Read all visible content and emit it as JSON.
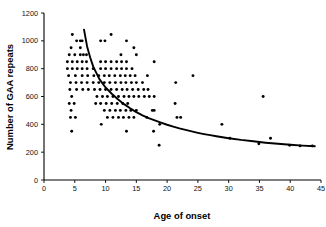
{
  "chart_data": {
    "type": "scatter",
    "title": "",
    "xlabel": "Age of onset",
    "ylabel": "Number of GAA repeats",
    "xlim": [
      0,
      45
    ],
    "ylim": [
      0,
      1200
    ],
    "xticks": [
      0,
      5,
      10,
      15,
      20,
      25,
      30,
      35,
      40,
      45
    ],
    "yticks": [
      0,
      200,
      400,
      600,
      800,
      1000,
      1200
    ],
    "grid": false,
    "legend": "none",
    "marker": "filled-circle",
    "marker_color": "#000000",
    "series": [
      {
        "name": "patients",
        "points": [
          [
            4.6,
            1045
          ],
          [
            6.2,
            1000
          ],
          [
            5.9,
            1000
          ],
          [
            5.3,
            1000
          ],
          [
            9.2,
            1000
          ],
          [
            9.9,
            1000
          ],
          [
            10.9,
            1045
          ],
          [
            13.4,
            1000
          ],
          [
            4.4,
            950
          ],
          [
            5.9,
            950
          ],
          [
            14.6,
            950
          ],
          [
            4.1,
            900
          ],
          [
            5.0,
            900
          ],
          [
            5.9,
            900
          ],
          [
            6.4,
            900
          ],
          [
            6.9,
            900
          ],
          [
            12.5,
            900
          ],
          [
            15.0,
            900
          ],
          [
            3.8,
            850
          ],
          [
            4.6,
            850
          ],
          [
            5.4,
            850
          ],
          [
            6.2,
            850
          ],
          [
            6.9,
            850
          ],
          [
            9.2,
            850
          ],
          [
            10.0,
            850
          ],
          [
            10.9,
            850
          ],
          [
            11.8,
            850
          ],
          [
            12.6,
            850
          ],
          [
            13.4,
            850
          ],
          [
            17.9,
            850
          ],
          [
            3.8,
            800
          ],
          [
            4.6,
            800
          ],
          [
            5.4,
            800
          ],
          [
            6.2,
            800
          ],
          [
            7.0,
            800
          ],
          [
            8.0,
            800
          ],
          [
            9.2,
            800
          ],
          [
            10.0,
            800
          ],
          [
            10.9,
            800
          ],
          [
            11.8,
            800
          ],
          [
            12.6,
            800
          ],
          [
            13.4,
            800
          ],
          [
            14.3,
            800
          ],
          [
            4.0,
            750
          ],
          [
            5.1,
            750
          ],
          [
            6.2,
            750
          ],
          [
            7.1,
            750
          ],
          [
            8.1,
            750
          ],
          [
            8.9,
            750
          ],
          [
            9.8,
            750
          ],
          [
            10.6,
            750
          ],
          [
            11.5,
            750
          ],
          [
            12.4,
            750
          ],
          [
            13.2,
            750
          ],
          [
            14.0,
            750
          ],
          [
            14.8,
            750
          ],
          [
            16.8,
            750
          ],
          [
            24.2,
            750
          ],
          [
            4.3,
            700
          ],
          [
            5.2,
            700
          ],
          [
            6.1,
            700
          ],
          [
            7.0,
            700
          ],
          [
            8.0,
            700
          ],
          [
            8.9,
            700
          ],
          [
            9.8,
            700
          ],
          [
            10.7,
            700
          ],
          [
            11.6,
            700
          ],
          [
            12.5,
            700
          ],
          [
            13.3,
            700
          ],
          [
            14.2,
            700
          ],
          [
            15.0,
            700
          ],
          [
            16.0,
            700
          ],
          [
            21.4,
            700
          ],
          [
            4.2,
            650
          ],
          [
            5.3,
            650
          ],
          [
            6.3,
            650
          ],
          [
            7.2,
            650
          ],
          [
            8.2,
            650
          ],
          [
            9.1,
            650
          ],
          [
            10.0,
            650
          ],
          [
            10.9,
            650
          ],
          [
            11.8,
            650
          ],
          [
            12.7,
            650
          ],
          [
            13.5,
            650
          ],
          [
            14.4,
            650
          ],
          [
            15.3,
            650
          ],
          [
            16.2,
            650
          ],
          [
            16.9,
            650
          ],
          [
            4.5,
            600
          ],
          [
            8.6,
            600
          ],
          [
            9.5,
            600
          ],
          [
            10.3,
            600
          ],
          [
            11.2,
            600
          ],
          [
            12.1,
            600
          ],
          [
            13.0,
            600
          ],
          [
            13.8,
            600
          ],
          [
            14.6,
            600
          ],
          [
            15.4,
            600
          ],
          [
            16.3,
            600
          ],
          [
            17.1,
            600
          ],
          [
            17.9,
            600
          ],
          [
            35.6,
            600
          ],
          [
            4.1,
            550
          ],
          [
            4.9,
            550
          ],
          [
            8.4,
            550
          ],
          [
            9.2,
            550
          ],
          [
            10.1,
            550
          ],
          [
            11.0,
            550
          ],
          [
            11.9,
            550
          ],
          [
            12.8,
            550
          ],
          [
            13.6,
            550
          ],
          [
            21.3,
            550
          ],
          [
            4.4,
            500
          ],
          [
            9.8,
            500
          ],
          [
            10.7,
            500
          ],
          [
            11.6,
            500
          ],
          [
            12.4,
            500
          ],
          [
            13.3,
            500
          ],
          [
            14.1,
            500
          ],
          [
            15.0,
            500
          ],
          [
            17.6,
            500
          ],
          [
            17.9,
            500
          ],
          [
            4.3,
            450
          ],
          [
            5.1,
            450
          ],
          [
            10.3,
            450
          ],
          [
            11.2,
            450
          ],
          [
            12.1,
            450
          ],
          [
            12.9,
            450
          ],
          [
            13.8,
            450
          ],
          [
            14.6,
            450
          ],
          [
            16.7,
            450
          ],
          [
            21.6,
            450
          ],
          [
            22.2,
            450
          ],
          [
            9.3,
            400
          ],
          [
            18.8,
            400
          ],
          [
            28.9,
            400
          ],
          [
            4.5,
            350
          ],
          [
            13.4,
            350
          ],
          [
            17.8,
            350
          ],
          [
            36.8,
            300
          ],
          [
            30.2,
            300
          ],
          [
            18.7,
            250
          ],
          [
            34.9,
            260
          ],
          [
            39.9,
            250
          ],
          [
            41.6,
            245
          ],
          [
            43.6,
            245
          ]
        ]
      }
    ],
    "fit_curve": {
      "name": "fitted exponential decay",
      "description": "smooth decreasing curve from (6.5,1080) to (44,240)",
      "points": [
        [
          6.5,
          1080
        ],
        [
          7,
          960
        ],
        [
          7.5,
          880
        ],
        [
          8,
          815
        ],
        [
          9,
          725
        ],
        [
          10,
          665
        ],
        [
          11,
          620
        ],
        [
          12,
          580
        ],
        [
          13,
          545
        ],
        [
          14,
          515
        ],
        [
          15,
          488
        ],
        [
          16,
          465
        ],
        [
          17,
          445
        ],
        [
          18,
          428
        ],
        [
          19,
          412
        ],
        [
          20,
          397
        ],
        [
          21,
          384
        ],
        [
          22,
          371
        ],
        [
          23,
          360
        ],
        [
          24,
          349
        ],
        [
          25,
          339
        ],
        [
          26,
          330
        ],
        [
          27,
          322
        ],
        [
          28,
          314
        ],
        [
          29,
          307
        ],
        [
          30,
          300
        ],
        [
          32,
          288
        ],
        [
          34,
          278
        ],
        [
          36,
          268
        ],
        [
          38,
          260
        ],
        [
          40,
          253
        ],
        [
          42,
          247
        ],
        [
          44,
          242
        ]
      ]
    }
  },
  "axes": {
    "x": {
      "title": "Age of onset",
      "labels": [
        "0",
        "5",
        "10",
        "15",
        "20",
        "25",
        "30",
        "35",
        "40",
        "45"
      ]
    },
    "y": {
      "title": "Number of GAA repeats",
      "labels": [
        "0",
        "200",
        "400",
        "600",
        "800",
        "1000",
        "1200"
      ]
    }
  }
}
